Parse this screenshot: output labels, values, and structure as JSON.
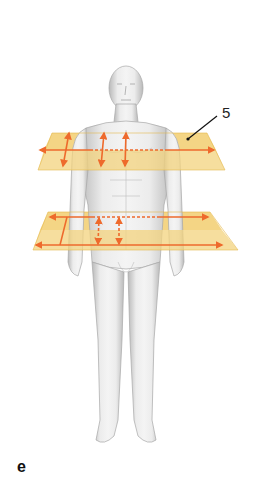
{
  "figure": {
    "panel_letter": "e",
    "callout_label": "5",
    "colors": {
      "plane_fill": "#f3d37e",
      "plane_edge": "#e4b94f",
      "arrow": "#ee6a2c",
      "body": "#e6e6e6",
      "body_shadow": "#b8b8b8",
      "leader_line": "#111111"
    },
    "planes": [
      {
        "name": "upper-transverse-plane",
        "level": "chest"
      },
      {
        "name": "lower-transverse-plane",
        "level": "waist"
      }
    ]
  }
}
